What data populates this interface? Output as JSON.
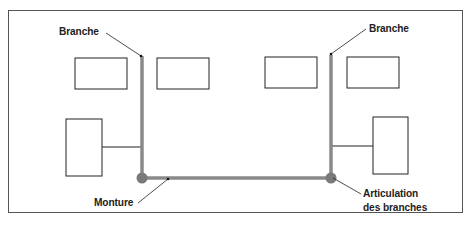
{
  "diagram": {
    "labels": {
      "branch_left": "Branche",
      "branch_right": "Branche",
      "mount": "Monture",
      "joint_line1": "Articulation",
      "joint_line2": "des branches"
    },
    "colors": {
      "frame_bar": "#8a8a8a",
      "joint": "#7a7a7a",
      "outline": "#222222"
    }
  }
}
